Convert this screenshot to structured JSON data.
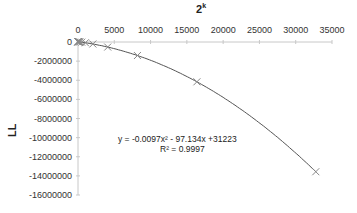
{
  "chart_data": {
    "type": "scatter",
    "title_base": "2",
    "title_exp": "k",
    "xlabel": "2^k",
    "ylabel": "LL",
    "xlim": [
      0,
      35000
    ],
    "ylim": [
      -16000000,
      0
    ],
    "x_ticks": [
      "0",
      "5000",
      "10000",
      "15000",
      "20000",
      "25000",
      "30000",
      "35000"
    ],
    "y_ticks": [
      "0",
      "-2000000",
      "-4000000",
      "-6000000",
      "-8000000",
      "-10000000",
      "-12000000",
      "-14000000",
      "-16000000"
    ],
    "x_axis_position": "top",
    "grid": false,
    "legend": null,
    "series": [
      {
        "name": "LL",
        "marker": "x",
        "x": [
          2,
          4,
          8,
          16,
          32,
          64,
          128,
          256,
          512,
          1024,
          2048,
          4096,
          8192,
          16384,
          32768
        ],
        "y": [
          31029,
          30835,
          30446,
          29669,
          28114,
          25006,
          18790,
          6356,
          -18500,
          -78424,
          -208575,
          -529392,
          -1415460,
          -4164040,
          -13566960
        ]
      }
    ],
    "trendline": {
      "type": "polynomial",
      "order": 2,
      "equation": "y = -0.0097x² - 97.134x +31223",
      "r_squared": "R² = 0.9997",
      "coefficients": {
        "a": -0.0097,
        "b": -97.134,
        "c": 31223
      }
    }
  },
  "labels": {
    "equation": "y = -0.0097x² - 97.134x +31223",
    "r_squared": "R² = 0.9997",
    "ylabel": "LL",
    "title_base": "2",
    "title_exp": "k"
  }
}
